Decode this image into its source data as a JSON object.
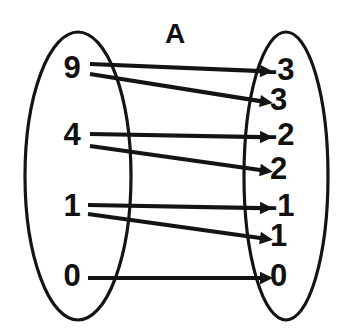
{
  "diagram": {
    "type": "mapping-diagram",
    "title": "A",
    "title_position": {
      "x": 175,
      "y": 36
    },
    "canvas": {
      "width": 353,
      "height": 334
    },
    "ink_color": "#141414",
    "text_color": "#111111",
    "background_color": "#ffffff",
    "domain_set": {
      "name": "domain-set",
      "ellipse": {
        "cx": 78,
        "cy": 176,
        "rx": 53,
        "ry": 144
      },
      "elements": [
        {
          "label": "9",
          "x": 72,
          "y": 70
        },
        {
          "label": "4",
          "x": 72,
          "y": 137
        },
        {
          "label": "1",
          "x": 72,
          "y": 208
        },
        {
          "label": "0",
          "x": 72,
          "y": 278
        }
      ]
    },
    "codomain_set": {
      "name": "codomain-set",
      "ellipse": {
        "cx": 286,
        "cy": 176,
        "rx": 42,
        "ry": 144
      },
      "elements": [
        {
          "label": "-3",
          "x": 267,
          "y": 72
        },
        {
          "label": "3",
          "x": 270,
          "y": 102
        },
        {
          "label": "-2",
          "x": 267,
          "y": 137
        },
        {
          "label": "2",
          "x": 270,
          "y": 171
        },
        {
          "label": "-1",
          "x": 267,
          "y": 208
        },
        {
          "label": "1",
          "x": 270,
          "y": 238
        },
        {
          "label": "0",
          "x": 270,
          "y": 278
        }
      ]
    },
    "mappings": [
      {
        "from": "9",
        "to": "-3",
        "x1": 90,
        "y1": 64,
        "x2": 260,
        "y2": 71
      },
      {
        "from": "9",
        "to": "3",
        "x1": 90,
        "y1": 74,
        "x2": 260,
        "y2": 101
      },
      {
        "from": "4",
        "to": "-2",
        "x1": 90,
        "y1": 134,
        "x2": 260,
        "y2": 137
      },
      {
        "from": "4",
        "to": "2",
        "x1": 90,
        "y1": 146,
        "x2": 260,
        "y2": 170
      },
      {
        "from": "1",
        "to": "-1",
        "x1": 88,
        "y1": 205,
        "x2": 260,
        "y2": 208
      },
      {
        "from": "1",
        "to": "1",
        "x1": 88,
        "y1": 214,
        "x2": 260,
        "y2": 238
      },
      {
        "from": "0",
        "to": "0",
        "x1": 88,
        "y1": 278,
        "x2": 260,
        "y2": 278
      }
    ]
  }
}
